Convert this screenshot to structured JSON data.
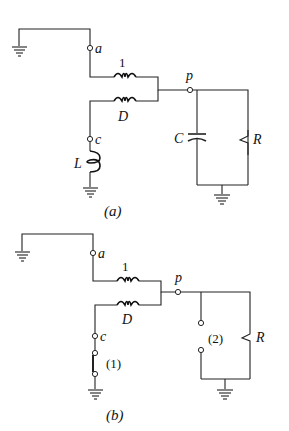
{
  "diagrams": [
    {
      "id": "a",
      "caption": "(a)",
      "labels": {
        "terminal_a": "a",
        "terminal_c": "c",
        "terminal_p": "p",
        "winding": "1",
        "device": "D",
        "inductor": "L",
        "capacitor": "C",
        "resistor": "R"
      }
    },
    {
      "id": "b",
      "caption": "(b)",
      "labels": {
        "terminal_a": "a",
        "terminal_c": "c",
        "terminal_p": "p",
        "winding": "1",
        "device": "D",
        "switch_1": "(1)",
        "switch_2": "(2)",
        "resistor": "R"
      }
    }
  ]
}
